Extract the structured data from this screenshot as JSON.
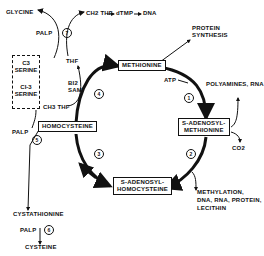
{
  "diagram": {
    "nodes": {
      "glycine": "GLYCINE",
      "ch2thf": "CH2 THF",
      "dtmp": "dTMP",
      "dna": "DNA",
      "palp_top": "PALP",
      "thf": "THF",
      "c3_serine_line1": "C3",
      "c3_serine_line2": "SERINE",
      "c13_serine_line1": "CI-3",
      "c13_serine_line2": "SERINE",
      "b12": "BI2",
      "sam_cofactor": "SAM",
      "ch3thf": "CH3 THF",
      "methionine": "METHIONINE",
      "protein_synthesis_line1": "PROTEIN",
      "protein_synthesis_line2": "SYNTHESIS",
      "atp": "ATP",
      "polyamines_rna": "POLYAMINES, RNA",
      "sam_line1": "S-ADENOSYL-",
      "sam_line2": "METHIONINE",
      "co2": "CO2",
      "homocysteine": "HOMOCYSTEINE",
      "sah_line1": "S-ADENOSYL-",
      "sah_line2": "HOMOCYSTEINE",
      "methylation_line1": "METHYLATION,",
      "methylation_line2": "DNA, RNA, PROTEIN,",
      "methylation_line3": "LECITHIN",
      "palp_left": "PALP",
      "cystathionine": "CYSTATHIONINE",
      "palp_bottom": "PALP",
      "cysteine": "CYSTEINE"
    },
    "steps": [
      "1",
      "2",
      "3",
      "4",
      "5",
      "6",
      "7"
    ]
  }
}
